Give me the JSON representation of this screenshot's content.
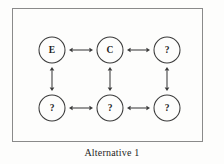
{
  "figure": {
    "caption": "Alternative 1",
    "frame": {
      "border_color": "#8a8a8a",
      "background": "#fdfdfc"
    }
  },
  "diagram": {
    "type": "node-link-grid",
    "stroke_color": "#3a3a3a",
    "label_color": "#1d1d1d",
    "rows": 2,
    "columns": 3,
    "node_radius": 13,
    "nodes": [
      {
        "id": "n1",
        "label": "E",
        "row": 0,
        "col": 0,
        "cx": 40,
        "cy": 42
      },
      {
        "id": "n2",
        "label": "C",
        "row": 0,
        "col": 1,
        "cx": 98,
        "cy": 42
      },
      {
        "id": "n3",
        "label": "?",
        "row": 0,
        "col": 2,
        "cx": 155,
        "cy": 42
      },
      {
        "id": "n4",
        "label": "?",
        "row": 1,
        "col": 0,
        "cx": 40,
        "cy": 100
      },
      {
        "id": "n5",
        "label": "?",
        "row": 1,
        "col": 1,
        "cx": 98,
        "cy": 100
      },
      {
        "id": "n6",
        "label": "?",
        "row": 1,
        "col": 2,
        "cx": 155,
        "cy": 100
      }
    ],
    "edges": [
      {
        "id": "e1",
        "from": "n1",
        "to": "n2",
        "orientation": "horizontal",
        "arrows": "double"
      },
      {
        "id": "e2",
        "from": "n2",
        "to": "n3",
        "orientation": "horizontal",
        "arrows": "double"
      },
      {
        "id": "e3",
        "from": "n4",
        "to": "n5",
        "orientation": "horizontal",
        "arrows": "double"
      },
      {
        "id": "e4",
        "from": "n5",
        "to": "n6",
        "orientation": "horizontal",
        "arrows": "double"
      },
      {
        "id": "e5",
        "from": "n1",
        "to": "n4",
        "orientation": "vertical",
        "arrows": "double"
      },
      {
        "id": "e6",
        "from": "n2",
        "to": "n5",
        "orientation": "vertical",
        "arrows": "double"
      },
      {
        "id": "e7",
        "from": "n3",
        "to": "n6",
        "orientation": "vertical",
        "arrows": "double"
      }
    ]
  }
}
